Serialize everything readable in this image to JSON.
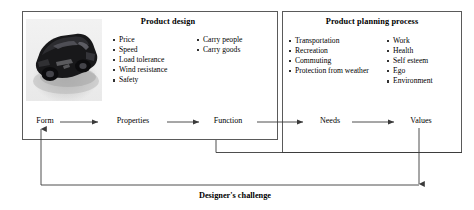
{
  "figure": {
    "caption_bottom": "Designer's challenge",
    "line_color": "#5a5a5a",
    "text_color": "#000000",
    "background": "#ffffff"
  },
  "panels": [
    {
      "id": "product-design",
      "title": "Product design",
      "columns": [
        {
          "items": [
            "Price",
            "Speed",
            "Load tolerance",
            "Wind resistance",
            "Safety"
          ]
        },
        {
          "items": [
            "Carry people",
            "Carry goods"
          ]
        }
      ]
    },
    {
      "id": "product-planning-process",
      "title": "Product planning process",
      "columns": [
        {
          "items": [
            "Transportation",
            "Recreation",
            "Commuting",
            "Protection from weather"
          ]
        },
        {
          "items": [
            "Work",
            "Health",
            "Self esteem",
            "Ego",
            "Environment"
          ]
        }
      ]
    }
  ],
  "flow": {
    "nodes": [
      {
        "id": "form",
        "label": "Form"
      },
      {
        "id": "properties",
        "label": "Properties"
      },
      {
        "id": "function",
        "label": "Function"
      },
      {
        "id": "needs",
        "label": "Needs"
      },
      {
        "id": "values",
        "label": "Values"
      }
    ],
    "arrows": [
      {
        "from": "form",
        "to": "properties"
      },
      {
        "from": "properties",
        "to": "function"
      },
      {
        "from": "function",
        "to": "needs"
      },
      {
        "from": "needs",
        "to": "values"
      }
    ],
    "feedback": [
      {
        "from": "function",
        "to": "planning-panel-right-edge",
        "style": "elbow"
      },
      {
        "from": "values",
        "to": "form",
        "style": "elbow-arrow"
      }
    ]
  },
  "image": {
    "car_photo_alt": "car-photo"
  }
}
